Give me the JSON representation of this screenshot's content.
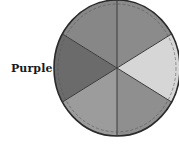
{
  "diagram": {
    "type": "color-wheel",
    "rendering": "grayscale",
    "center": [
      117,
      68
    ],
    "radius_x": 63,
    "radius_y": 68,
    "labels": [
      {
        "text": "Purple",
        "segment": "left"
      }
    ],
    "segments": [
      {
        "position": "top-right",
        "start_deg": -90,
        "end_deg": -30,
        "fill": "#8b8b8b"
      },
      {
        "position": "right",
        "start_deg": -30,
        "end_deg": 30,
        "fill": "#d6d6d6"
      },
      {
        "position": "bottom-right",
        "start_deg": 30,
        "end_deg": 90,
        "fill": "#8f8f8f"
      },
      {
        "position": "bottom-left",
        "start_deg": 90,
        "end_deg": 150,
        "fill": "#9c9c9c"
      },
      {
        "position": "left",
        "start_deg": 150,
        "end_deg": 210,
        "fill": "#6b6b6b",
        "label": "Purple"
      },
      {
        "position": "top-left",
        "start_deg": 210,
        "end_deg": 270,
        "fill": "#878787"
      }
    ],
    "outline_color": "#2a2a2a",
    "divider_color": "#3a3a3a"
  }
}
